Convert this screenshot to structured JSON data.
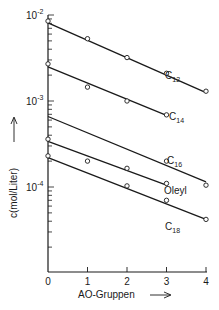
{
  "chart_data": {
    "type": "line",
    "title": "",
    "xlabel": "AO-Gruppen",
    "ylabel": "c(mol/Liter)",
    "yscale": "log",
    "ylim": [
      3e-05,
      0.01
    ],
    "xlim": [
      0,
      4
    ],
    "x_ticks": [
      "0",
      "1",
      "2",
      "3",
      "4"
    ],
    "y_ticks": [
      {
        "value": 0.01,
        "label": "10",
        "exp": "-2"
      },
      {
        "value": 0.001,
        "label": "10",
        "exp": "-3"
      },
      {
        "value": 0.0001,
        "label": "10",
        "exp": "-4"
      }
    ],
    "grid": false,
    "legend": "inline labels next to lines",
    "series": [
      {
        "name": "C12",
        "label": "C",
        "sub": "12",
        "points": [
          [
            0,
            0.0085
          ],
          [
            1,
            0.0053
          ],
          [
            2,
            0.0032
          ],
          [
            3,
            0.0021
          ],
          [
            4,
            0.0013
          ]
        ],
        "fit": [
          [
            0,
            0.0081
          ],
          [
            4,
            0.00125
          ]
        ]
      },
      {
        "name": "C14",
        "label": "C",
        "sub": "14",
        "points": [
          [
            0,
            0.0027
          ],
          [
            1,
            0.00145
          ],
          [
            2,
            0.001
          ],
          [
            3,
            0.00069
          ]
        ],
        "fit": [
          [
            0,
            0.0025
          ],
          [
            3,
            0.00068
          ]
        ]
      },
      {
        "name": "C16",
        "label": "C",
        "sub": "16",
        "points": [
          [
            3,
            0.0002
          ],
          [
            4,
            0.000105
          ]
        ],
        "fit": [
          [
            0,
            0.00066
          ],
          [
            4,
            0.000115
          ]
        ]
      },
      {
        "name": "Oleyl",
        "label": "Oleyl",
        "sub": "",
        "points": [
          [
            0,
            0.00036
          ],
          [
            1,
            0.0002
          ],
          [
            2,
            0.000165
          ],
          [
            3,
            0.00011
          ]
        ],
        "fit": [
          [
            0,
            0.00034
          ],
          [
            3,
            0.000105
          ]
        ]
      },
      {
        "name": "C18",
        "label": "C",
        "sub": "18",
        "points": [
          [
            0,
            0.00023
          ],
          [
            2,
            0.000103
          ],
          [
            3,
            7e-05
          ],
          [
            4,
            4.2e-05
          ]
        ],
        "fit": [
          [
            0,
            0.00022
          ],
          [
            4,
            4.2e-05
          ]
        ]
      }
    ]
  }
}
